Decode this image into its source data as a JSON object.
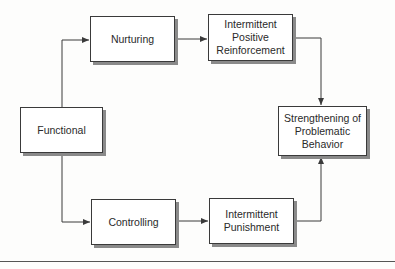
{
  "diagram": {
    "nodes": [
      {
        "id": "functional",
        "label": "Functional"
      },
      {
        "id": "nurturing",
        "label": "Nurturing"
      },
      {
        "id": "controlling",
        "label": "Controlling"
      },
      {
        "id": "ipr",
        "label": "Intermittent\nPositive\nReinforcement"
      },
      {
        "id": "ip",
        "label": "Intermittent\nPunishment"
      },
      {
        "id": "strengthening",
        "label": "Strengthening of\nProblematic\nBehavior"
      }
    ],
    "edges": [
      {
        "from": "functional",
        "to": "nurturing"
      },
      {
        "from": "functional",
        "to": "controlling"
      },
      {
        "from": "nurturing",
        "to": "ipr"
      },
      {
        "from": "controlling",
        "to": "ip"
      },
      {
        "from": "ipr",
        "to": "strengthening"
      },
      {
        "from": "ip",
        "to": "strengthening"
      }
    ],
    "colors": {
      "line": "#3a3a3a",
      "shadow": "#8a8a8a",
      "text": "#2a2a2a"
    }
  }
}
